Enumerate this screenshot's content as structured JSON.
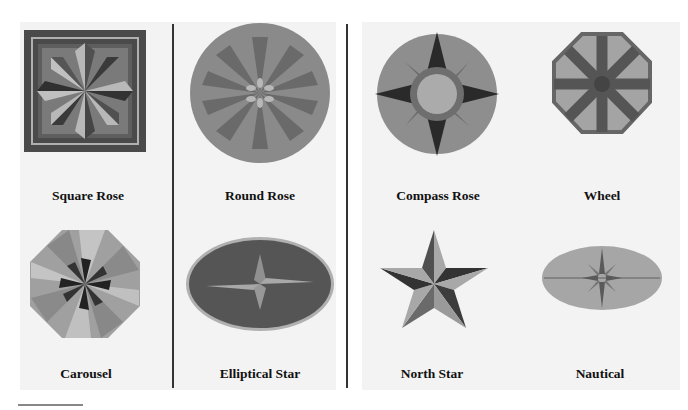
{
  "page": {
    "background": "#ffffff",
    "panel_background": "#f3f3f3"
  },
  "panels": [
    {
      "items": [
        {
          "label": "Square Rose",
          "icon": "square-rose-medallion"
        },
        {
          "label": "Round Rose",
          "icon": "round-rose-medallion"
        },
        {
          "label": "Carousel",
          "icon": "carousel-medallion"
        },
        {
          "label": "Elliptical Star",
          "icon": "elliptical-star-medallion"
        }
      ]
    },
    {
      "items": [
        {
          "label": "Compass Rose",
          "icon": "compass-rose-medallion"
        },
        {
          "label": "Wheel",
          "icon": "wheel-medallion"
        },
        {
          "label": "North Star",
          "icon": "north-star-medallion"
        },
        {
          "label": "Nautical",
          "icon": "nautical-medallion"
        }
      ]
    }
  ],
  "colors": {
    "dark": "#3a3a3a",
    "mid": "#6e6e6e",
    "light": "#a8a8a8",
    "pale": "#c8c8c8",
    "divider": "#333333"
  }
}
